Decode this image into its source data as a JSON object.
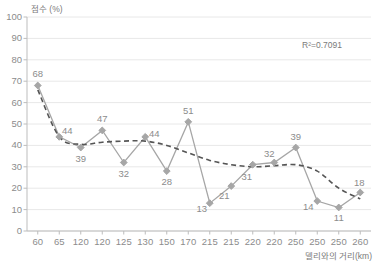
{
  "chart_data": {
    "type": "line",
    "title": "",
    "ylabel": "점수 (%)",
    "xlabel": "델리와의 거리(km)",
    "annotation": "R²=0.7091",
    "ylim": [
      0,
      100
    ],
    "ytick_values": [
      0,
      10,
      20,
      30,
      40,
      50,
      60,
      70,
      80,
      90,
      100
    ],
    "yticks": [
      "0",
      "10",
      "20",
      "30",
      "40",
      "50",
      "60",
      "70",
      "80",
      "90",
      "100"
    ],
    "categories": [
      "60",
      "65",
      "120",
      "120",
      "125",
      "130",
      "150",
      "170",
      "215",
      "215",
      "220",
      "220",
      "250",
      "250",
      "250",
      "260"
    ],
    "values": [
      68,
      44,
      39,
      47,
      32,
      44,
      28,
      51,
      13,
      21,
      31,
      32,
      39,
      14,
      11,
      18
    ],
    "data_labels": [
      "68",
      "44",
      "39",
      "47",
      "32",
      "44",
      "28",
      "51",
      "13",
      "21",
      "31",
      "32",
      "39",
      "14",
      "11",
      "18"
    ],
    "label_offsets": [
      "above",
      "above",
      "below",
      "above",
      "below",
      "above",
      "below",
      "above",
      "below",
      "below",
      "below",
      "above",
      "above",
      "below",
      "below",
      "above"
    ],
    "grid": true,
    "legend": false,
    "series": [
      {
        "name": "점수",
        "style": "solid-diamond-marker",
        "color": "#a6a6a6"
      },
      {
        "name": "추세선",
        "style": "dashed-polynomial-trendline",
        "color": "#4d4d4d",
        "values": [
          66,
          44,
          40.5,
          41.5,
          42,
          42,
          40,
          36.5,
          33,
          31,
          30,
          30.5,
          31,
          28,
          20,
          15
        ]
      }
    ],
    "colors": {
      "marker": "#a6a6a6",
      "line": "#a6a6a6",
      "trendline": "#555555",
      "grid": "#e8e8e8",
      "axis": "#bdbdbd",
      "text": "#8c8c8c"
    }
  }
}
